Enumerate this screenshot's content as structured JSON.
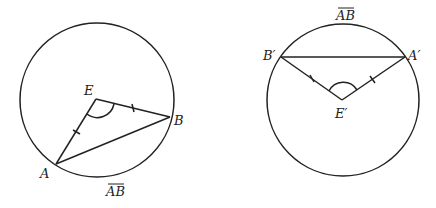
{
  "diagram": {
    "left": {
      "circle": {
        "cx": 97,
        "cy": 100,
        "r": 77
      },
      "points": {
        "E": {
          "label": "E",
          "x": 96,
          "y": 99
        },
        "A": {
          "label": "A",
          "x": 56,
          "y": 164
        },
        "B": {
          "label": "B",
          "x": 170,
          "y": 117
        }
      },
      "arc_label": "AB",
      "segments": [
        "EA",
        "EB",
        "AB"
      ],
      "tick_marks": [
        "EA",
        "EB"
      ],
      "angle_mark": "AEB"
    },
    "right": {
      "circle": {
        "cx": 343,
        "cy": 100,
        "r": 76
      },
      "points": {
        "E": {
          "label": "E′",
          "x": 342,
          "y": 100
        },
        "A": {
          "label": "A′",
          "x": 405,
          "y": 57
        },
        "B": {
          "label": "B′",
          "x": 281,
          "y": 57
        }
      },
      "arc_label": "AB",
      "segments": [
        "E′A′",
        "E′B′",
        "A′B′"
      ],
      "tick_marks": [
        "E′A′",
        "E′B′"
      ],
      "angle_mark": "A′E′B′"
    }
  },
  "colors": {
    "stroke": "#222222",
    "background": "#ffffff"
  }
}
